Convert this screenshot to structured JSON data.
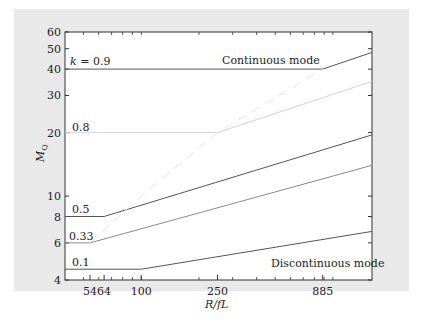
{
  "chart_data": {
    "type": "line",
    "title": "",
    "xlabel": "R/fL",
    "ylabel": "M_Q",
    "xscale": "log",
    "yscale": "log",
    "xlim": [
      40,
      1600
    ],
    "ylim": [
      4,
      60
    ],
    "x_ticks": [
      54,
      64,
      100,
      250,
      885
    ],
    "x_tick_labels": [
      "54",
      "64",
      "100",
      "250",
      "885"
    ],
    "y_ticks": [
      4,
      6,
      8,
      10,
      20,
      30,
      40,
      50,
      60
    ],
    "y_tick_labels": [
      "4",
      "6",
      "8",
      "10",
      "20",
      "30",
      "40",
      "50",
      "60"
    ],
    "grid": false,
    "annotations": [
      "Continuous mode",
      "Discontinuous mode"
    ],
    "series": [
      {
        "name": "k = 0.9",
        "label": "k = 0.9",
        "color": "#555555",
        "x": [
          40,
          885,
          1600
        ],
        "y": [
          40,
          40,
          48
        ]
      },
      {
        "name": "k = 0.8",
        "label": "0.8",
        "color": "#d4d4d4",
        "x": [
          40,
          250,
          1600
        ],
        "y": [
          20,
          20,
          35
        ]
      },
      {
        "name": "k = 0.5",
        "label": "0.5",
        "color": "#555555",
        "x": [
          40,
          64,
          1600
        ],
        "y": [
          8,
          8,
          19.5
        ]
      },
      {
        "name": "k = 0.33",
        "label": "0.33",
        "color": "#8a8a8a",
        "x": [
          40,
          54,
          1600
        ],
        "y": [
          6,
          6,
          14
        ]
      },
      {
        "name": "k = 0.1",
        "label": "0.1",
        "color": "#555555",
        "x": [
          40,
          100,
          1600
        ],
        "y": [
          4.5,
          4.5,
          6.8
        ]
      },
      {
        "name": "mode boundary",
        "label": "",
        "color": "#e6e6e6",
        "dashed": true,
        "x": [
          54,
          100,
          250,
          885
        ],
        "y": [
          6,
          10,
          20,
          40
        ]
      }
    ]
  },
  "labels": {
    "k09": "k = 0.9",
    "k08": "0.8",
    "k05": "0.5",
    "k033": "0.33",
    "k01": "0.1",
    "continuous": "Continuous mode",
    "discontinuous": "Discontinuous mode",
    "xlabel": "R/fL",
    "ylabel_main": "M",
    "ylabel_sub": "Q"
  }
}
